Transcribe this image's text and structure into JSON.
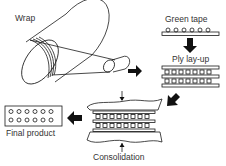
{
  "diagram": {
    "steps": [
      {
        "id": "wrap",
        "label": "Wrap"
      },
      {
        "id": "green-tape",
        "label": "Green tape"
      },
      {
        "id": "ply-layup",
        "label": "Ply lay-up"
      },
      {
        "id": "consolidation",
        "label": "Consolidation"
      },
      {
        "id": "final-product",
        "label": "Final product"
      }
    ],
    "colors": {
      "stroke": "#1a1a1a",
      "arrow": "#111111",
      "text": "#333333",
      "background": "#ffffff"
    }
  }
}
